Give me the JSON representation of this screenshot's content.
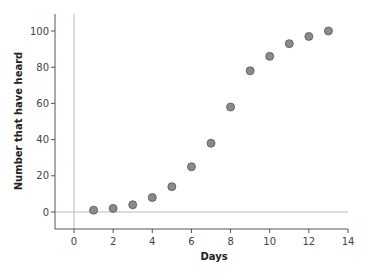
{
  "chart_data": {
    "type": "scatter",
    "title": "",
    "xlabel": "Days",
    "ylabel": "Number that have heard",
    "xlim": [
      -1,
      14
    ],
    "ylim": [
      -10,
      110
    ],
    "xticks": [
      0,
      2,
      4,
      6,
      8,
      10,
      12,
      14
    ],
    "yticks": [
      0,
      20,
      40,
      60,
      80,
      100
    ],
    "grid": false,
    "reference_lines": {
      "x": 0,
      "y": 0
    },
    "series": [
      {
        "name": "Number that have heard",
        "x": [
          1,
          2,
          3,
          4,
          5,
          6,
          7,
          8,
          9,
          10,
          11,
          12,
          13
        ],
        "y": [
          1,
          2,
          4,
          8,
          14,
          25,
          38,
          58,
          78,
          86,
          93,
          97,
          100
        ]
      }
    ]
  },
  "colors": {
    "marker_fill": "#8a8a8a",
    "marker_stroke": "#555555",
    "axis": "#555555",
    "reference_line": "#bbbbbb"
  }
}
